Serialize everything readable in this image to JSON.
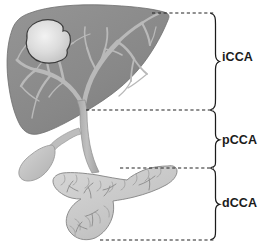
{
  "figure": {
    "background_color": "#ffffff"
  },
  "regions": [
    {
      "id": "intrahepatic",
      "label": "iCCA",
      "full_name": "intrahepatic cholangiocarcinoma",
      "bracket_top_y": 13,
      "bracket_bottom_y": 110,
      "label_y": 57
    },
    {
      "id": "perihilar",
      "label": "pCCA",
      "full_name": "perihilar cholangiocarcinoma",
      "bracket_top_y": 110,
      "bracket_bottom_y": 168,
      "label_y": 140
    },
    {
      "id": "distal",
      "label": "dCCA",
      "full_name": "distal cholangiocarcinoma",
      "bracket_top_y": 168,
      "bracket_bottom_y": 240,
      "label_y": 203
    }
  ],
  "divider_lines": [
    {
      "id": "divider-top",
      "y": 13,
      "x_start": 152,
      "x_end": 214
    },
    {
      "id": "divider-hilum",
      "y": 110,
      "x_start": 86,
      "x_end": 214
    },
    {
      "id": "divider-pancreas-top",
      "y": 168,
      "x_start": 120,
      "x_end": 214
    },
    {
      "id": "divider-bottom",
      "y": 240,
      "x_start": 100,
      "x_end": 214
    }
  ],
  "anatomy": {
    "liver": {
      "name": "liver",
      "fill_color": "#8b8b8b",
      "outline_color": "#6f6f6f"
    },
    "tumor": {
      "name": "intrahepatic tumor mass",
      "fill_color": "#d9d9d9",
      "outline_color": "#3a3a3a"
    },
    "bile_ducts": {
      "name": "intrahepatic bile duct tree",
      "fill_color": "#b9b9b9"
    },
    "common_bile_duct": {
      "name": "common bile duct",
      "fill_color": "#b2b2b2",
      "outline_color": "#8e8e8e"
    },
    "gallbladder": {
      "name": "gallbladder",
      "fill_color": "#c4c4c4",
      "outline_color": "#9a9a9a"
    },
    "cystic_duct": {
      "name": "cystic duct",
      "fill_color": "#bdbdbd"
    },
    "pancreas": {
      "name": "pancreas",
      "fill_color": "#cacaca",
      "outline_color": "#8d8d8d"
    },
    "pancreatic_duct": {
      "name": "pancreatic duct",
      "stroke_color": "#8a8a8a"
    }
  },
  "bracket": {
    "stroke_color": "#1b1b1b"
  },
  "divider": {
    "stroke_color": "#222222"
  }
}
